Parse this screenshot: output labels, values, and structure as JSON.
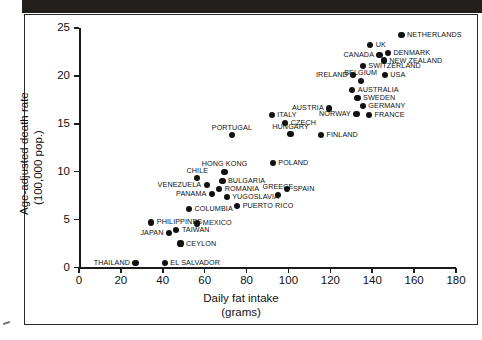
{
  "chart_data": {
    "type": "scatter",
    "title": "",
    "xlabel": "Daily fat intake",
    "xlabel_units": "(grams)",
    "ylabel_line1": "Age-adjusted death rate",
    "ylabel_line2": "(100,000 pop.)",
    "xlim": [
      0,
      180
    ],
    "ylim": [
      0,
      25
    ],
    "xticks": [
      0,
      20,
      40,
      60,
      80,
      100,
      120,
      140,
      160,
      180
    ],
    "yticks": [
      0,
      5,
      10,
      15,
      20,
      25
    ],
    "grid": false,
    "legend": "none",
    "points": [
      {
        "label": "NETHERLANDS",
        "x": 154.0,
        "y": 24.3,
        "side": "l"
      },
      {
        "label": "UK",
        "x": 139.0,
        "y": 23.2,
        "side": "l"
      },
      {
        "label": "CANADA",
        "x": 143.5,
        "y": 22.2,
        "side": "r"
      },
      {
        "label": "DENMARK",
        "x": 147.5,
        "y": 22.4,
        "side": "l"
      },
      {
        "label": "NEW ZEALAND",
        "x": 145.5,
        "y": 21.6,
        "side": "l"
      },
      {
        "label": "SWITZERLAND",
        "x": 135.5,
        "y": 21.0,
        "side": "l"
      },
      {
        "label": "IRELAND",
        "x": 131.0,
        "y": 20.1,
        "side": "r"
      },
      {
        "label": "USA",
        "x": 146.0,
        "y": 20.1,
        "side": "l"
      },
      {
        "label": "BELGIUM",
        "x": 134.5,
        "y": 19.5,
        "side": "c"
      },
      {
        "label": "AUSTRALIA",
        "x": 130.5,
        "y": 18.5,
        "side": "l"
      },
      {
        "label": "SWEDEN",
        "x": 133.0,
        "y": 17.7,
        "side": "l"
      },
      {
        "label": "GERMANY",
        "x": 135.5,
        "y": 16.9,
        "side": "l"
      },
      {
        "label": "NORWAY",
        "x": 132.5,
        "y": 16.0,
        "side": "r"
      },
      {
        "label": "FRANCE",
        "x": 138.5,
        "y": 15.9,
        "side": "l"
      },
      {
        "label": "AUSTRIA",
        "x": 119.5,
        "y": 16.6,
        "side": "r"
      },
      {
        "label": "ITALY",
        "x": 92.0,
        "y": 15.9,
        "side": "l"
      },
      {
        "label": "CZECH",
        "x": 98.5,
        "y": 15.1,
        "side": "l"
      },
      {
        "label": "HUNGARY",
        "x": 101.0,
        "y": 13.9,
        "side": "c"
      },
      {
        "label": "FINLAND",
        "x": 115.5,
        "y": 13.8,
        "side": "l"
      },
      {
        "label": "PORTUGAL",
        "x": 73.0,
        "y": 13.8,
        "side": "c"
      },
      {
        "label": "POLAND",
        "x": 92.5,
        "y": 10.9,
        "side": "l"
      },
      {
        "label": "HONG KONG",
        "x": 69.5,
        "y": 10.0,
        "side": "c"
      },
      {
        "label": "CHILE",
        "x": 56.5,
        "y": 9.3,
        "side": "c"
      },
      {
        "label": "BULGARIA",
        "x": 68.5,
        "y": 9.0,
        "side": "l"
      },
      {
        "label": "VENEZUELA",
        "x": 61.0,
        "y": 8.6,
        "side": "r"
      },
      {
        "label": "ROMANIA",
        "x": 67.0,
        "y": 8.2,
        "side": "l"
      },
      {
        "label": "PANAMA",
        "x": 63.5,
        "y": 7.7,
        "side": "r"
      },
      {
        "label": "YUGOSLAVIA",
        "x": 70.5,
        "y": 7.4,
        "side": "l"
      },
      {
        "label": "SPAIN",
        "x": 99.5,
        "y": 8.2,
        "side": "l"
      },
      {
        "label": "GREECE",
        "x": 95.0,
        "y": 7.6,
        "side": "c"
      },
      {
        "label": "PUERTO RICO",
        "x": 75.5,
        "y": 6.4,
        "side": "l"
      },
      {
        "label": "COLUMBIA",
        "x": 52.5,
        "y": 6.1,
        "side": "l"
      },
      {
        "label": "MEXICO",
        "x": 56.5,
        "y": 4.6,
        "side": "l"
      },
      {
        "label": "PHILIPPINES",
        "x": 34.5,
        "y": 4.7,
        "side": "l"
      },
      {
        "label": "JAPAN",
        "x": 43.0,
        "y": 3.6,
        "side": "r"
      },
      {
        "label": "TAIWAN",
        "x": 46.5,
        "y": 3.9,
        "side": "l"
      },
      {
        "label": "CEYLON",
        "x": 48.5,
        "y": 2.5,
        "side": "l"
      },
      {
        "label": "THAILAND",
        "x": 27.0,
        "y": 0.5,
        "side": "r"
      },
      {
        "label": "EL SALVADOR",
        "x": 41.0,
        "y": 0.5,
        "side": "l"
      }
    ]
  }
}
